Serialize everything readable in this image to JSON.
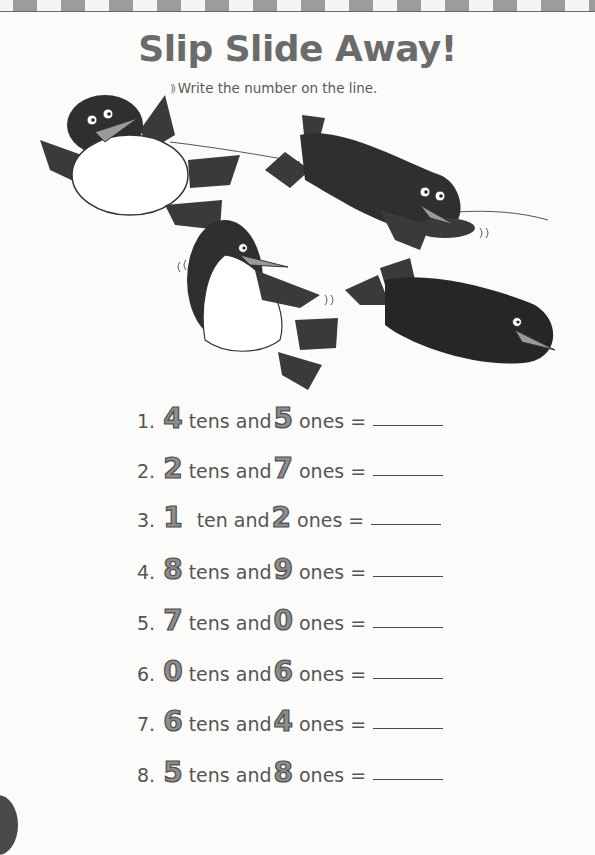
{
  "worksheet": {
    "title": "Slip Slide Away!",
    "instruction": "Write the number on the line.",
    "instruction_icon": "sound-waves-icon",
    "illustration": {
      "description": "Four cartoon penguins sliding on ice",
      "penguin_count": 4
    },
    "colors": {
      "numeral_fill": "#8d8d8d",
      "numeral_outline": "#4e4e4e",
      "penguin_body": "#3a3a3a",
      "penguin_beak": "#9a9a9a",
      "title": "#6b6b6b"
    },
    "problems": [
      {
        "label": "1.",
        "tens": "4",
        "tens_word": "tens and",
        "ones": "5",
        "ones_word": "ones ="
      },
      {
        "label": "2.",
        "tens": "2",
        "tens_word": "tens and",
        "ones": "7",
        "ones_word": "ones ="
      },
      {
        "label": "3.",
        "tens": "1",
        "tens_word": "ten and",
        "ones": "2",
        "ones_word": "ones ="
      },
      {
        "label": "4.",
        "tens": "8",
        "tens_word": "tens and",
        "ones": "9",
        "ones_word": "ones ="
      },
      {
        "label": "5.",
        "tens": "7",
        "tens_word": "tens and",
        "ones": "0",
        "ones_word": "ones ="
      },
      {
        "label": "6.",
        "tens": "0",
        "tens_word": "tens and",
        "ones": "6",
        "ones_word": "ones ="
      },
      {
        "label": "7.",
        "tens": "6",
        "tens_word": "tens and",
        "ones": "4",
        "ones_word": "ones ="
      },
      {
        "label": "8.",
        "tens": "5",
        "tens_word": "tens and",
        "ones": "8",
        "ones_word": "ones ="
      }
    ]
  }
}
